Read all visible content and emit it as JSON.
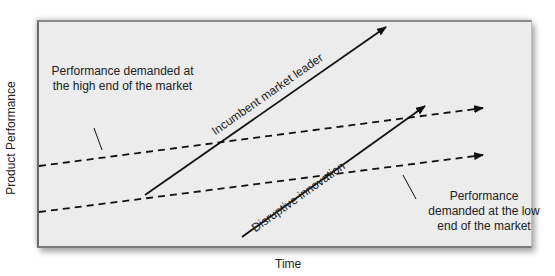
{
  "diagram": {
    "axes": {
      "y_label": "Product Performance",
      "x_label": "Time"
    },
    "annotations": {
      "high_end": "Performance demanded at the high end of the market",
      "low_end": "Performance demanded at the low end of the market"
    },
    "lines": [
      {
        "name": "Performance demanded at the high end of the market",
        "style": "dashed",
        "from": [
          38,
          166
        ],
        "to": [
          483,
          108
        ]
      },
      {
        "name": "Performance demanded at the low end of the market",
        "style": "dashed",
        "from": [
          38,
          212
        ],
        "to": [
          483,
          155
        ]
      },
      {
        "name": "Incumbent market leader",
        "style": "solid",
        "from": [
          145,
          195
        ],
        "to": [
          386,
          27
        ]
      },
      {
        "name": "Disruptive innovation",
        "style": "solid",
        "from": [
          242,
          237
        ],
        "to": [
          425,
          106
        ]
      }
    ],
    "line_labels": {
      "incumbent": "Incumbent market leader",
      "disruptive": "Disruptive innovation"
    },
    "colors": {
      "background": "#ececec",
      "line": "#111111",
      "text": "#222222"
    }
  }
}
